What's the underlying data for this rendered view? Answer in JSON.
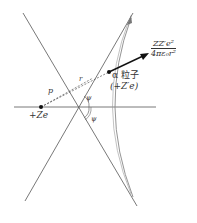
{
  "diagram": {
    "type": "rutherford-scattering-geometry",
    "nucleus": {
      "label": "+Ze"
    },
    "particle": {
      "name_label": "α 粒子",
      "charge_label": "(+Z′e)"
    },
    "distances": {
      "impact_parameter": "p",
      "radius": "r"
    },
    "angles": {
      "upper": "ψ",
      "lower": "ψ"
    },
    "force": {
      "numerator": "ZZ′e²",
      "denominator": "4πε₀r²"
    },
    "colors": {
      "line": "#555555",
      "curve": "#777777",
      "arrow": "#111111",
      "text": "#333333"
    }
  }
}
